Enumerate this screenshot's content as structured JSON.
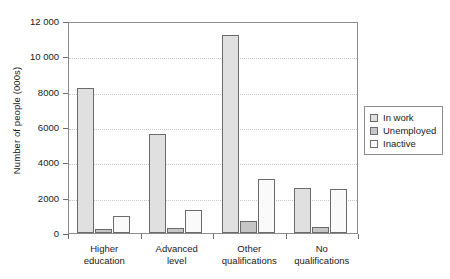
{
  "chart_data": {
    "type": "bar",
    "title": "",
    "xlabel": "",
    "ylabel": "Number of people (000s)",
    "categories": [
      "Higher education",
      "Advanced level",
      "Other qualifications",
      "No qualifications"
    ],
    "category_lines": [
      [
        "Higher",
        "education"
      ],
      [
        "Advanced",
        "level"
      ],
      [
        "Other",
        "qualifications"
      ],
      [
        "No",
        "qualifications"
      ]
    ],
    "series": [
      {
        "name": "In work",
        "color": "#e0e0e0",
        "values": [
          8200,
          5600,
          11200,
          2550
        ]
      },
      {
        "name": "Unemployed",
        "color": "#c6c6c6",
        "values": [
          230,
          300,
          700,
          350
        ]
      },
      {
        "name": "Inactive",
        "color": "#fafafa",
        "values": [
          950,
          1300,
          3050,
          2500
        ]
      }
    ],
    "ylim": [
      0,
      12000
    ],
    "ytick_values": [
      0,
      2000,
      4000,
      6000,
      8000,
      10000,
      12000
    ],
    "ytick_labels": [
      "0",
      "2000",
      "4000",
      "6000",
      "8000",
      "10 000",
      "12 000"
    ],
    "grid": true,
    "legend_position": "right",
    "legend_entries": [
      "In work",
      "Unemployed",
      "Inactive"
    ]
  }
}
